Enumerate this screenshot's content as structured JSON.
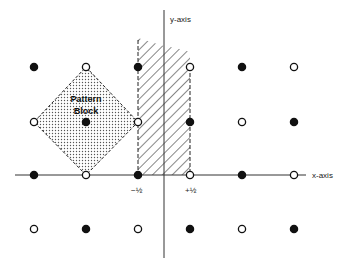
{
  "diagram": {
    "axes": {
      "x_label": "x-axis",
      "y_label": "y-axis",
      "tick_minus_half": "−½",
      "tick_plus_half": "+½"
    },
    "pattern_block": {
      "label_line1": "Pattern",
      "label_line2": "Block",
      "fill": "stippled dots"
    },
    "hatched_region": {
      "description": "strip between x = -1/2 and x = +1/2"
    },
    "legend_markers": {
      "filled": "filled-circle",
      "open": "open-circle"
    },
    "lattice_points": [
      {
        "row": 0,
        "col": 0,
        "type": "filled"
      },
      {
        "row": 0,
        "col": 1,
        "type": "open"
      },
      {
        "row": 0,
        "col": 2,
        "type": "filled"
      },
      {
        "row": 0,
        "col": 3,
        "type": "open"
      },
      {
        "row": 0,
        "col": 4,
        "type": "filled"
      },
      {
        "row": 0,
        "col": 5,
        "type": "open"
      },
      {
        "row": 1,
        "col": 0,
        "type": "open"
      },
      {
        "row": 1,
        "col": 1,
        "type": "filled"
      },
      {
        "row": 1,
        "col": 2,
        "type": "open"
      },
      {
        "row": 1,
        "col": 3,
        "type": "filled"
      },
      {
        "row": 1,
        "col": 4,
        "type": "open"
      },
      {
        "row": 1,
        "col": 5,
        "type": "filled"
      },
      {
        "row": 2,
        "col": 0,
        "type": "filled"
      },
      {
        "row": 2,
        "col": 1,
        "type": "open"
      },
      {
        "row": 2,
        "col": 2,
        "type": "filled"
      },
      {
        "row": 2,
        "col": 3,
        "type": "open"
      },
      {
        "row": 2,
        "col": 4,
        "type": "filled"
      },
      {
        "row": 2,
        "col": 5,
        "type": "open"
      },
      {
        "row": 3,
        "col": 0,
        "type": "open"
      },
      {
        "row": 3,
        "col": 1,
        "type": "filled"
      },
      {
        "row": 3,
        "col": 2,
        "type": "open"
      },
      {
        "row": 3,
        "col": 3,
        "type": "filled"
      },
      {
        "row": 3,
        "col": 4,
        "type": "open"
      },
      {
        "row": 3,
        "col": 5,
        "type": "filled"
      }
    ]
  }
}
